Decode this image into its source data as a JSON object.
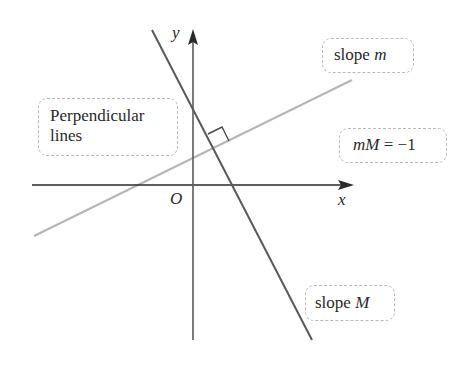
{
  "diagram": {
    "title_box": {
      "line1": "Perpendicular",
      "line2": "lines"
    },
    "axes": {
      "x_label": "x",
      "y_label": "y",
      "origin_label": "O"
    },
    "lines": [
      {
        "name": "line-m",
        "label_prefix": "slope ",
        "label_var": "m",
        "color": "#b5b5b5"
      },
      {
        "name": "line-M",
        "label_prefix": "slope ",
        "label_var": "M",
        "color": "#5a5a5a"
      }
    ],
    "relation": {
      "lhs": "mM",
      "eq": " = ",
      "rhs": "−1"
    },
    "colors": {
      "axis": "#2a2a2a",
      "steep_line": "#5a5a5a",
      "shallow_line": "#b5b5b5",
      "box_border": "#b9b9b9"
    }
  }
}
